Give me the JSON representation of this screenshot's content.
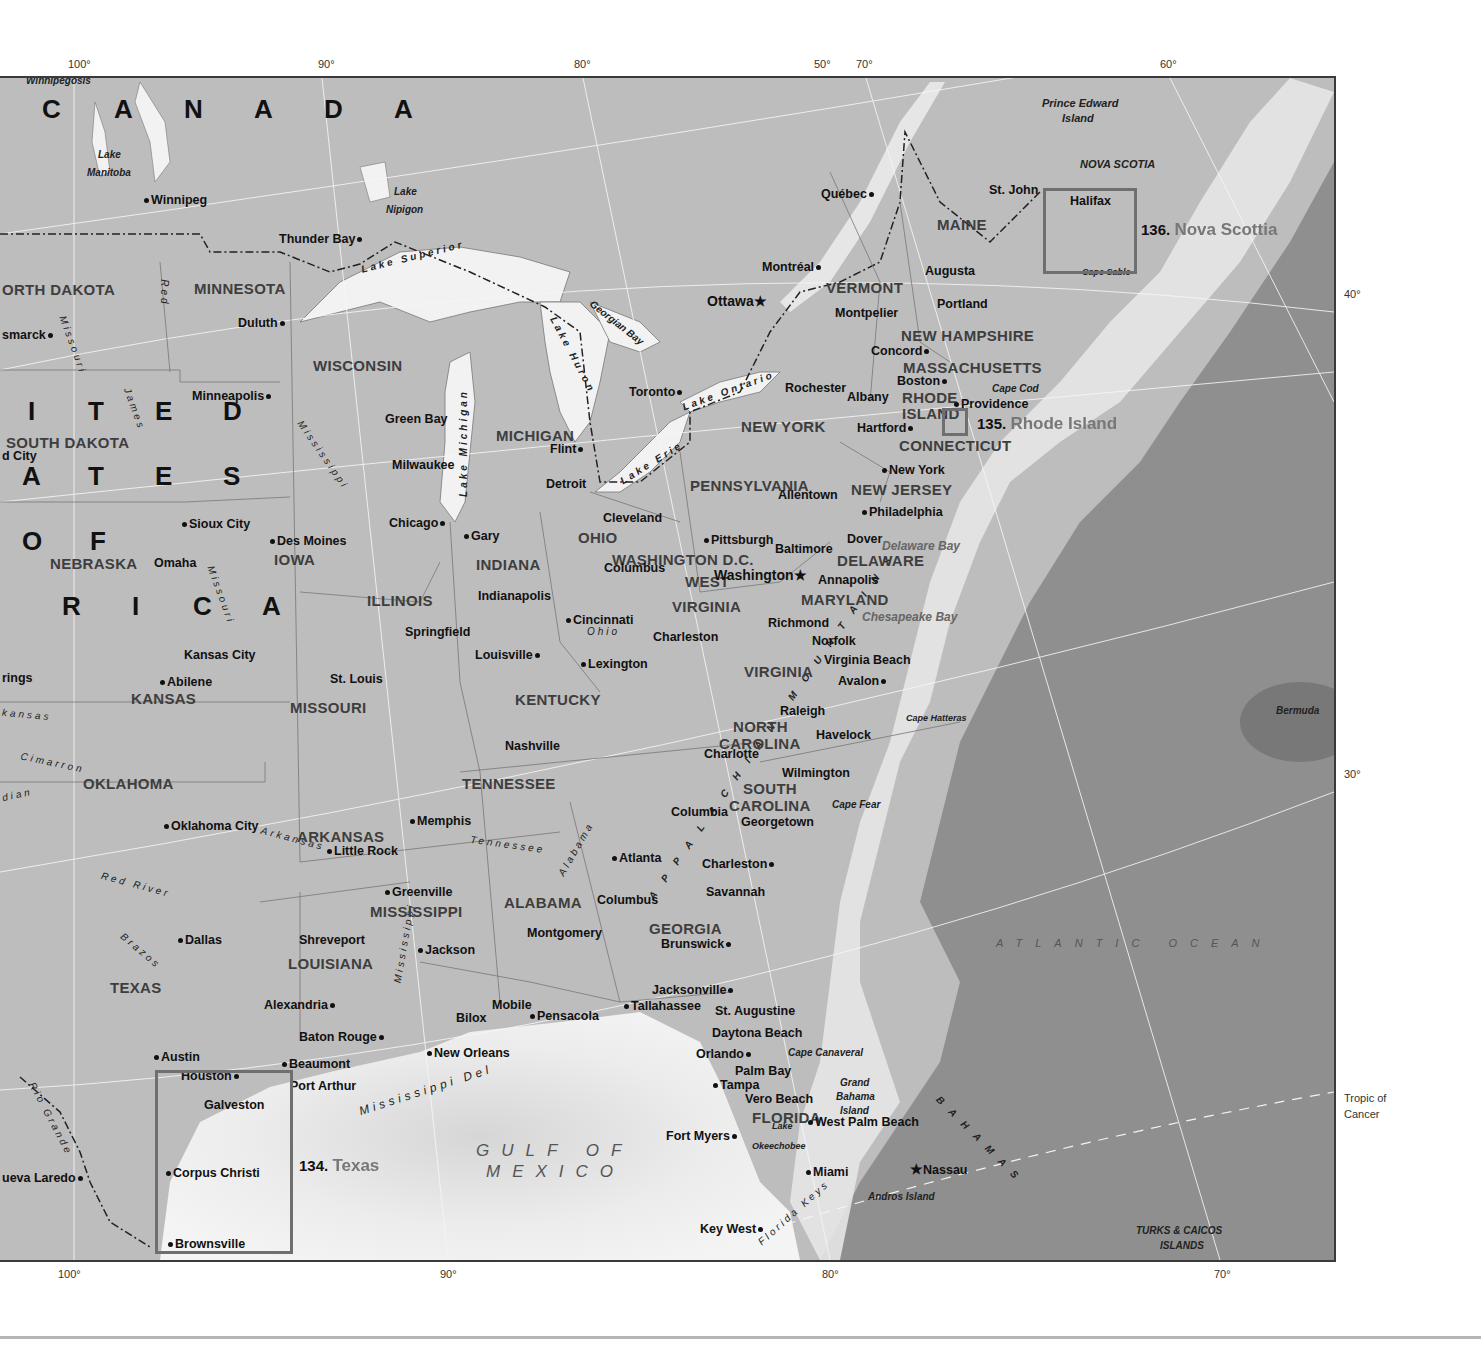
{
  "map": {
    "title_region": "Eastern United States and Atlantic Canada",
    "countries": {
      "canada": [
        "C",
        "A",
        "N",
        "A",
        "D",
        "A"
      ],
      "usa_row1": [
        "I",
        "T",
        "E",
        "D"
      ],
      "usa_row2": [
        "A",
        "T",
        "E",
        "S"
      ],
      "usa_row3": [
        "O",
        "F"
      ],
      "usa_row4": [
        "R",
        "I",
        "C",
        "A"
      ]
    },
    "longitude_ticks_top": [
      "100°",
      "90°",
      "80°",
      "50°",
      "70°",
      "60°"
    ],
    "longitude_ticks_bottom": [
      "100°",
      "90°",
      "80°",
      "70°"
    ],
    "latitude_ticks_right": [
      "40°",
      "30°"
    ],
    "tropic_label": [
      "Tropic of",
      "Cancer"
    ],
    "states": [
      "ORTH DAKOTA",
      "MINNESOTA",
      "WISCONSIN",
      "MICHIGAN",
      "SOUTH DAKOTA",
      "NEBRASKA",
      "IOWA",
      "ILLINOIS",
      "INDIANA",
      "OHIO",
      "PENNSYLVANIA",
      "NEW YORK",
      "VERMONT",
      "MAINE",
      "NEW HAMPSHIRE",
      "MASSACHUSETTS",
      "RHODE",
      "ISLAND",
      "CONNECTICUT",
      "NEW JERSEY",
      "DELAWARE",
      "MARYLAND",
      "WASHINGTON D.C.",
      "WEST",
      "VIRGINIA",
      "VIRGINIA",
      "KANSAS",
      "MISSOURI",
      "KENTUCKY",
      "NORTH",
      "CAROLINA",
      "SOUTH",
      "CAROLINA",
      "TENNESSEE",
      "OKLAHOMA",
      "ARKANSAS",
      "MISSISSIPPI",
      "ALABAMA",
      "GEORGIA",
      "TEXAS",
      "LOUISIANA",
      "FLORIDA",
      "NOVA SCOTIA"
    ],
    "cities": [
      "Winnipeg",
      "Thunder Bay",
      "Duluth",
      "smarck",
      "Minneapolis",
      "Green Bay",
      "Milwaukee",
      "Chicago",
      "Gary",
      "Detroit",
      "Flint",
      "Toronto",
      "Ottawa",
      "Montréal",
      "Québec",
      "St. John",
      "Halifax",
      "Augusta",
      "Portland",
      "Montpelier",
      "Concord",
      "Boston",
      "Albany",
      "Rochester",
      "Hartford",
      "Providence",
      "New York",
      "Allentown",
      "Philadelphia",
      "Dover",
      "Baltimore",
      "Washington",
      "Annapolis",
      "Pittsburgh",
      "Cleveland",
      "Columbus",
      "Cincinnati",
      "Charleston",
      "Richmond",
      "Norfolk",
      "Virginia Beach",
      "Avalon",
      "Raleigh",
      "Havelock",
      "Charlotte",
      "Wilmington",
      "Columbia",
      "Georgetown",
      "Charleston",
      "Savannah",
      "Brunswick",
      "Atlanta",
      "Columbus",
      "Montgomery",
      "Jacksonville",
      "St. Augustine",
      "Daytona Beach",
      "Orlando",
      "Palm Bay",
      "Tampa",
      "Vero Beach",
      "West Palm Beach",
      "Fort Myers",
      "Miami",
      "Key West",
      "Nassau",
      "Tallahassee",
      "Pensacola",
      "Mobile",
      "Bilox",
      "New Orleans",
      "Baton Rouge",
      "Alexandria",
      "Shreveport",
      "Jackson",
      "Greenville",
      "Memphis",
      "Little Rock",
      "Nashville",
      "Louisville",
      "Lexington",
      "Indianapolis",
      "Springfield",
      "St. Louis",
      "Kansas City",
      "Abilene",
      "Sioux City",
      "Des Moines",
      "Omaha",
      "Oklahoma City",
      "Dallas",
      "Austin",
      "Houston",
      "Beaumont",
      "Port Arthur",
      "Galveston",
      "Corpus Christi",
      "Brownsville",
      "ueva Laredo",
      "d City",
      "rings"
    ],
    "waters": [
      "Winnipegosis",
      "Lake Manitoba",
      "Lake Nipigon",
      "Lake Superior",
      "Georgian Bay",
      "Lake Huron",
      "Lake Michigan",
      "Lake Erie",
      "Lake Ontario",
      "Lake Okeechobee",
      "Delaware Bay",
      "Chesapeake Bay",
      "GULF OF MEXICO",
      "ATLANTIC OCEAN"
    ],
    "rivers": [
      "Red",
      "Missouri",
      "James",
      "Mississippi",
      "Ohio",
      "Tennessee",
      "Alabama",
      "Arkansas",
      "Red River",
      "Brazos",
      "Rio Grande",
      "Cimarron",
      "Canadian",
      "Kansas",
      "Mississippi Delta"
    ],
    "features": [
      "Prince Edward Island",
      "Cape Sable",
      "Cape Cod",
      "Cape Hatteras",
      "Cape Fear",
      "Cape Canaveral",
      "Grand Bahama Island",
      "Andros Island",
      "BAHAMAS",
      "TURKS & CAICOS ISLANDS",
      "Bermuda",
      "Florida Keys",
      "APPALACHIAN MOUNTAINS"
    ],
    "insets": [
      {
        "number": "134.",
        "name": "Texas"
      },
      {
        "number": "135.",
        "name": "Rhode Island"
      },
      {
        "number": "136.",
        "name": "Nova Scottia"
      }
    ]
  },
  "labels": {
    "winnipegosis": "Winnipegosis",
    "lake_manitoba_1": "Lake",
    "lake_manitoba_2": "Manitoba",
    "lake_nipigon_1": "Lake",
    "lake_nipigon_2": "Nipigon",
    "lake_superior": "Lake Superior",
    "georgian_bay": "Georgian Bay",
    "lake_huron": "Lake Huron",
    "lake_michigan": "Lake Michigan",
    "lake_erie": "Lake Erie",
    "lake_ontario": "Lake Ontario",
    "pei_1": "Prince Edward",
    "pei_2": "Island",
    "nova_scotia": "NOVA SCOTIA",
    "cape_sable": "Cape Sable",
    "cape_cod": "Cape Cod",
    "delaware_bay": "Delaware Bay",
    "chesapeake_bay": "Chesapeake Bay",
    "cape_hatteras": "Cape Hatteras",
    "cape_fear": "Cape Fear",
    "cape_canaveral": "Cape Canaveral",
    "bermuda": "Bermuda",
    "atlantic": "ATLANTIC OCEAN",
    "gulf_1": "GULF OF",
    "gulf_2": "MEXICO",
    "grand_bahama_1": "Grand",
    "grand_bahama_2": "Bahama",
    "grand_bahama_3": "Island",
    "andros": "Andros Island",
    "bahamas": "BAHAMAS",
    "turks_1": "TURKS & CAICOS",
    "turks_2": "ISLANDS",
    "lake_okee_1": "Lake",
    "lake_okee_2": "Okeechobee",
    "florida_keys": "Florida Keys",
    "appalachian": "APPALACHIAN MOUNTAINS",
    "miss_delta": "Mississippi Del",
    "r_red": "Red",
    "r_missouri1": "Missouri",
    "r_james": "James",
    "r_miss1": "Mississippi",
    "r_missouri2": "Missouri",
    "r_ohio": "Ohio",
    "r_tennessee": "Tennessee",
    "r_alabama": "Alabama",
    "r_arkansas": "Arkansas",
    "r_redriver": "Red River",
    "r_brazos": "Brazos",
    "r_rio": "Rio Grande",
    "r_cimarron": "Cimarron",
    "r_canadian": "dian",
    "r_kansas": "kansas",
    "r_miss2": "Mississippi",
    "s_ndakota": "ORTH DAKOTA",
    "s_minnesota": "MINNESOTA",
    "s_wisconsin": "WISCONSIN",
    "s_michigan": "MICHIGAN",
    "s_sdakota": "SOUTH DAKOTA",
    "s_nebraska": "NEBRASKA",
    "s_iowa": "IOWA",
    "s_illinois": "ILLINOIS",
    "s_indiana": "INDIANA",
    "s_ohio": "OHIO",
    "s_penn": "PENNSYLVANIA",
    "s_ny": "NEW YORK",
    "s_vermont": "VERMONT",
    "s_maine": "MAINE",
    "s_nh": "NEW HAMPSHIRE",
    "s_mass": "MASSACHUSETTS",
    "s_ri1": "RHODE",
    "s_ri2": "ISLAND",
    "s_conn": "CONNECTICUT",
    "s_nj": "NEW JERSEY",
    "s_del": "DELAWARE",
    "s_md": "MARYLAND",
    "s_dc": "WASHINGTON D.C.",
    "s_wv1": "WEST",
    "s_wv2": "VIRGINIA",
    "s_va": "VIRGINIA",
    "s_kansas": "KANSAS",
    "s_missouri": "MISSOURI",
    "s_kentucky": "KENTUCKY",
    "s_nc1": "NORTH",
    "s_nc2": "CAROLINA",
    "s_sc1": "SOUTH",
    "s_sc2": "CAROLINA",
    "s_tennessee": "TENNESSEE",
    "s_oklahoma": "OKLAHOMA",
    "s_arkansas": "ARKANSAS",
    "s_mississippi": "MISSISSIPPI",
    "s_alabama": "ALABAMA",
    "s_georgia": "GEORGIA",
    "s_texas": "TEXAS",
    "s_louisiana": "LOUISIANA",
    "s_florida": "FLORIDA",
    "tropic_1": "Tropic of",
    "tropic_2": "Cancer"
  },
  "colors": {
    "land": "#bdbdbd",
    "lake": "#f2f2f2",
    "shelf": "#eeeeee",
    "deep_ocean": "#8a8a8a",
    "inset_box": "#6f6f6f",
    "state_label": "#3e3e3e"
  }
}
